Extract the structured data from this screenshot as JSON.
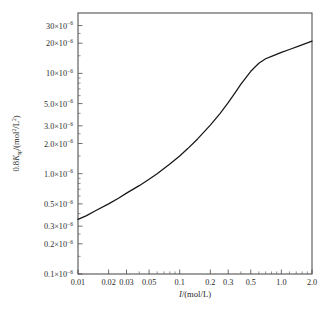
{
  "figure": {
    "background_color": "#ffffff",
    "frame_color": "#4a4a4a",
    "curve_color": "#171717"
  },
  "axis": {
    "x_title_plain": "I/(mol/L)",
    "x_title_italic_part": "I",
    "x_title_rest": "/(mol/L)",
    "y_title_plain": "0.8Ksp/(mol2/L2)",
    "y_title_prefix": "0.8",
    "y_title_symbol": "K",
    "y_title_sub": "sp",
    "y_title_unit_open": "/(mol",
    "y_title_unit_sup1": "2",
    "y_title_unit_mid": "/L",
    "y_title_unit_sup2": "2",
    "y_title_unit_close": ")"
  },
  "x_ticks": [
    {
      "value": 0.01,
      "label": "0.01",
      "major": true
    },
    {
      "value": 0.02,
      "label": "0.02",
      "major": true
    },
    {
      "value": 0.03,
      "label": "0.03",
      "major": true
    },
    {
      "value": 0.05,
      "label": "0.05",
      "major": true
    },
    {
      "value": 0.1,
      "label": "0.1",
      "major": true
    },
    {
      "value": 0.2,
      "label": "0.2",
      "major": true
    },
    {
      "value": 0.3,
      "label": "0.3",
      "major": true
    },
    {
      "value": 0.5,
      "label": "0.5",
      "major": true
    },
    {
      "value": 1.0,
      "label": "1.0",
      "major": true
    },
    {
      "value": 2.0,
      "label": "2.0",
      "major": true
    }
  ],
  "x_minor_ticks": [
    0.04,
    0.06,
    0.07,
    0.08,
    0.09,
    0.4,
    0.6,
    0.7,
    0.8,
    0.9,
    1.2,
    1.4,
    1.6,
    1.8
  ],
  "y_ticks": [
    {
      "value": 3e-05,
      "mantissa": "30",
      "label": "30×10",
      "exp": "−6",
      "major": true
    },
    {
      "value": 2e-05,
      "mantissa": "20",
      "label": "20×10",
      "exp": "−6",
      "major": true
    },
    {
      "value": 1e-05,
      "mantissa": "10",
      "label": "10×10",
      "exp": "−6",
      "major": true
    },
    {
      "value": 5e-06,
      "mantissa": "5.0",
      "label": "5.0×10",
      "exp": "−6",
      "major": true
    },
    {
      "value": 3e-06,
      "mantissa": "3.0",
      "label": "3.0×10",
      "exp": "−6",
      "major": true
    },
    {
      "value": 2e-06,
      "mantissa": "2.0",
      "label": "2.0×10",
      "exp": "−6",
      "major": true
    },
    {
      "value": 1e-06,
      "mantissa": "1.0",
      "label": "1.0×10",
      "exp": "−6",
      "major": true
    },
    {
      "value": 5e-07,
      "mantissa": "0.5",
      "label": "0.5×10",
      "exp": "−6",
      "major": true
    },
    {
      "value": 3e-07,
      "mantissa": "0.3",
      "label": "0.3×10",
      "exp": "−6",
      "major": true
    },
    {
      "value": 2e-07,
      "mantissa": "0.2",
      "label": "0.2×10",
      "exp": "−6",
      "major": true
    },
    {
      "value": 1e-07,
      "mantissa": "0.1",
      "label": "0.1×10",
      "exp": "−6",
      "major": true
    }
  ],
  "y_minor_ticks": [
    4e-07,
    6e-07,
    7e-07,
    8e-07,
    9e-07,
    4e-06,
    6e-06,
    7e-06,
    8e-06,
    9e-06,
    1.5e-07,
    2.5e-07,
    1.5e-06,
    2.5e-06,
    1.5e-05,
    2.5e-05
  ],
  "caption": {
    "text": ""
  },
  "chart_data": {
    "type": "line",
    "title": "",
    "xlabel": "I/(mol/L)",
    "ylabel": "0.8Ksp/(mol²/L²)",
    "xscale": "log",
    "yscale": "log",
    "xlim": [
      0.01,
      2.0
    ],
    "ylim": [
      1e-07,
      4e-05
    ],
    "grid": false,
    "legend": false,
    "x": [
      0.01,
      0.012,
      0.015,
      0.02,
      0.025,
      0.03,
      0.04,
      0.05,
      0.06,
      0.08,
      0.1,
      0.12,
      0.15,
      0.2,
      0.25,
      0.3,
      0.35,
      0.4,
      0.5,
      0.6,
      0.7,
      0.8,
      1.0,
      1.2,
      1.5,
      2.0
    ],
    "y": [
      3.5e-07,
      3.8e-07,
      4.3e-07,
      5e-07,
      5.7e-07,
      6.4e-07,
      7.6e-07,
      8.8e-07,
      1e-06,
      1.25e-06,
      1.5e-06,
      1.78e-06,
      2.22e-06,
      3.05e-06,
      4e-06,
      5.1e-06,
      6.4e-06,
      7.8e-06,
      1.05e-05,
      1.26e-05,
      1.4e-05,
      1.48e-05,
      1.62e-05,
      1.73e-05,
      1.88e-05,
      2.1e-05
    ],
    "series": [
      {
        "name": "0.8Ksp vs ionic strength",
        "values": [
          3.5e-07,
          3.8e-07,
          4.3e-07,
          5e-07,
          5.7e-07,
          6.4e-07,
          7.6e-07,
          8.8e-07,
          1e-06,
          1.25e-06,
          1.5e-06,
          1.78e-06,
          2.22e-06,
          3.05e-06,
          4e-06,
          5.1e-06,
          6.4e-06,
          7.8e-06,
          1.05e-05,
          1.26e-05,
          1.4e-05,
          1.48e-05,
          1.62e-05,
          1.73e-05,
          1.88e-05,
          2.1e-05
        ]
      }
    ]
  }
}
